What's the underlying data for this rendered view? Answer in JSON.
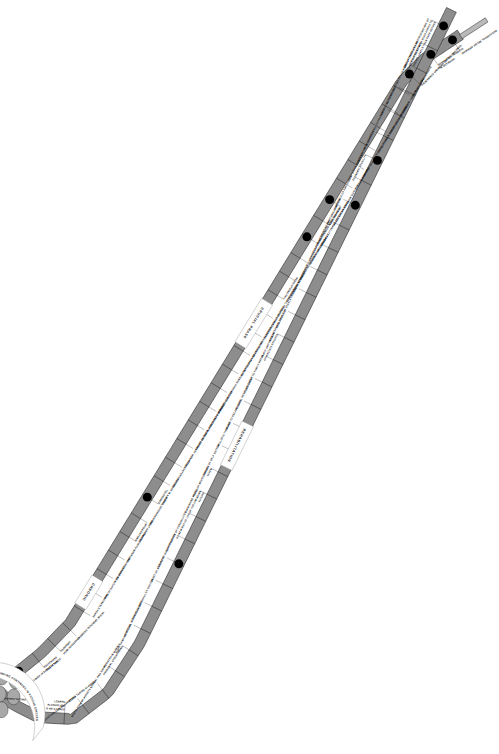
{
  "orientation": "rotated-90",
  "colors": {
    "road": "#8d8d8d",
    "road_edge": "#111111",
    "node": "#000000",
    "bubble": "#a8a8a8",
    "background": "#ffffff",
    "text": "#111111"
  },
  "phases": [
    {
      "id": "crucial",
      "label": "CRUCIAL   PHASE"
    },
    {
      "id": "chronic",
      "label": "CHRONIC"
    },
    {
      "id": "rehabilitation",
      "label": "REHABILITATION"
    }
  ],
  "vicious_circle": {
    "label": "OBSESSIVE DRINKING CONTINUES IN VICIOUS CIRCLES",
    "bubble_count": 9
  },
  "descent": {
    "name": "Progression of Alcoholism (downward)",
    "steps": [
      {
        "i": 0,
        "label": "OCCASIONAL RELIEF DRINKING",
        "node": true
      },
      {
        "i": 1,
        "label": "INCREASE IN\nALCOHOL TOLERANCE",
        "node": true
      },
      {
        "i": 2,
        "label": "CONSTANT RELIEF DRINKING COMMENCES",
        "node": true
      },
      {
        "i": 3,
        "label": "SURREPTITIOUS DRINKING",
        "node": false
      },
      {
        "i": 4,
        "label": "ONSET OF MEMORY BLACKOUTS",
        "node": false
      },
      {
        "i": 5,
        "label": "URGENCY OF FIRST DRINKS",
        "node": false
      },
      {
        "i": 6,
        "label": "INCREASING DEPENDENCE ON ALCOHOL",
        "node": false
      },
      {
        "i": 7,
        "label": "UNABLE TO DISCUSS PROBLEM",
        "node": false
      },
      {
        "i": 8,
        "label": "FEELINGS OF GUILT",
        "node": false
      },
      {
        "i": 9,
        "label": "MEMORY BLACKOUTS INCREASE",
        "node": true
      },
      {
        "i": 10,
        "label": "DRINKING BOLSTERED\nWITH EXCUSES",
        "node": false
      },
      {
        "i": 11,
        "label": "DECREASE OF ABILITY TO STOP\nDRINKING WHEN OTHERS DO SO",
        "node": true
      },
      {
        "i": 12,
        "label": "PERSISTENT REMORSE",
        "node": false
      },
      {
        "i": 13,
        "label": "GRANDIOSE AND AGGRESSIVE BEHAVIOUR",
        "node": false
      },
      {
        "i": 14,
        "label": "PROMISES AND\nRESOLUTIONS FAIL",
        "node": false
      },
      {
        "i": 15,
        "label": "EFFORTS TO CONTROL FAIL REPEATEDLY",
        "node": false
      },
      {
        "i": 16,
        "label": "LOSS OF OTHER INTERESTS",
        "node": false
      },
      {
        "i": 17,
        "label": "TRIES GEOGRAPHICAL ESCAPES",
        "node": false
      },
      {
        "i": 18,
        "label": "WORK AND MONEY TROUBLES",
        "node": false
      },
      {
        "i": 19,
        "label": "FAMILY AND FRIENDS AVOIDED",
        "node": false
      },
      {
        "i": 20,
        "label": "NEGLECT OF FOOD",
        "node": false
      },
      {
        "i": 21,
        "label": "UNREASONABLE RESENTMENTS",
        "node": false
      },
      {
        "i": 22,
        "label": "TREMORS AND EARLY MORNING DRINKS",
        "node": false
      },
      {
        "i": 23,
        "label": "LOSS OF ORDINARY WILL POWER",
        "node": false
      },
      {
        "i": 24,
        "label": "PHYSICAL DETERIORATION",
        "node": false
      },
      {
        "i": 25,
        "label": "DECREASE IN ALCOHOL\nTOLERANCE",
        "node": true
      },
      {
        "i": 26,
        "label": "MORAL DETERIORATION",
        "node": false
      },
      {
        "i": 27,
        "label": "ONSET OF LENGTHY\nINTOXICATIONS",
        "node": false
      },
      {
        "i": 28,
        "label": "DRINKING WITH INFERIORS",
        "node": false
      },
      {
        "i": 29,
        "label": "IMPAIRED THINKING",
        "node": false
      },
      {
        "i": 30,
        "label": "UNABLE TO INITIATE ACTION",
        "node": false
      },
      {
        "i": 31,
        "label": "INDEFINABLE FEARS",
        "node": false
      },
      {
        "i": 32,
        "label": "VAGUE SPIRITUAL DESIRES",
        "node": false
      },
      {
        "i": 33,
        "label": "OBSESSION WITH\nDRINKING",
        "node": false
      },
      {
        "i": 34,
        "label": "ALL ALIBIS\nEXHAUSTED",
        "node": false
      },
      {
        "i": 35,
        "label": "COMPLETE DEFEAT ADMITTED",
        "node": true
      }
    ]
  },
  "ascent": {
    "name": "Rehabilitation and Recovery (upward)",
    "steps": [
      {
        "i": 0,
        "label": "HONEST DESIRE FOR HELP",
        "node": true
      },
      {
        "i": 1,
        "label": "LEARNS\nALCOHOLISM\nIS AN ILLNESS",
        "node": false
      },
      {
        "i": 2,
        "label": "TOLD ADDICTION CAN BE ARRESTED",
        "node": false
      },
      {
        "i": 3,
        "label": "STOPS TAKING ALCOHOL",
        "node": false
      },
      {
        "i": 4,
        "label": "MEETS FORMER ADDICTS NORMAL AND HAPPY",
        "node": false
      },
      {
        "i": 5,
        "label": "ASSISTED IN MAKING\nPERSONAL STOCKTAKING",
        "node": false
      },
      {
        "i": 6,
        "label": "RIGHT THINKING BEGINS",
        "node": false
      },
      {
        "i": 7,
        "label": "SPIRITUAL NEEDS EXAMINED",
        "node": false
      },
      {
        "i": 8,
        "label": "PHYSICAL OVERHAUL BY DOCTOR",
        "node": false
      },
      {
        "i": 9,
        "label": "ONSET OF NEW HOPE",
        "node": true
      },
      {
        "i": 10,
        "label": "START OF GROUP THERAPY",
        "node": false
      },
      {
        "i": 11,
        "label": "APPRECIATION OF POSSIBILITIES\nOF NEW WAY OF LIFE",
        "node": false
      },
      {
        "i": 12,
        "label": "DIMINISHING FEARS\nOF THE UNKNOWN\nFUTURE",
        "node": false
      },
      {
        "i": 13,
        "label": "REGULAR NOURISHMENT\nTAKEN",
        "node": false
      },
      {
        "i": 14,
        "label": "RETURN OF SELF ESTEEM",
        "node": false
      },
      {
        "i": 15,
        "label": "REALISTIC THINKING",
        "node": false
      },
      {
        "i": 16,
        "label": "DESIRE TO ESCAPE GOES",
        "node": false
      },
      {
        "i": 17,
        "label": "NATURAL REST AND SLEEP",
        "node": false
      },
      {
        "i": 18,
        "label": "ADJUSTMENT TO FAMILY NEEDS",
        "node": false
      },
      {
        "i": 19,
        "label": "FAMILY AND FRIENDS\nAPPRECIATE EFFORTS",
        "node": false
      },
      {
        "i": 20,
        "label": "NEW INTERESTS DEVELOP",
        "node": false
      },
      {
        "i": 21,
        "label": "NEW CIRCLE OF STABLE FRIENDS",
        "node": false
      },
      {
        "i": 22,
        "label": "RE-BIRTH OF IDEALS",
        "node": false
      },
      {
        "i": 23,
        "label": "FACTS FACED WITH COURAGE",
        "node": false
      },
      {
        "i": 24,
        "label": "APPRECIATION OF REAL VALUES",
        "node": false
      },
      {
        "i": 25,
        "label": "INCREASE OF EMOTIONAL CONTROL",
        "node": true
      },
      {
        "i": 26,
        "label": "CONFIDENCE OF EMPLOYERS",
        "node": false
      },
      {
        "i": 27,
        "label": "FIRST STEPS TOWARDS\nECONOMIC STABILITY",
        "node": true
      },
      {
        "i": 28,
        "label": "CONTENTMENT IN SOBRIETY",
        "node": false
      },
      {
        "i": 29,
        "label": "CARE OF PERSONAL APPEARANCE",
        "node": false
      },
      {
        "i": 30,
        "label": "INCREASING TOLERANCE",
        "node": false
      },
      {
        "i": 31,
        "label": "RATIONALISATIONS RECOGNISED",
        "node": false
      },
      {
        "i": 32,
        "label": "GROUP THERAPY AND\nMUTUAL HELP CONTINUE",
        "node": false
      },
      {
        "i": 33,
        "label": "ENLIGHTENED AND INTERESTING WAY OF\nLIFE OPENS UP WITH ROAD AHEAD TO\nHIGHER LEVELS THAN EVER BEFORE",
        "node": true
      }
    ]
  }
}
